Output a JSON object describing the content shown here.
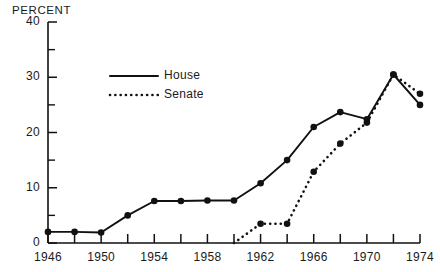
{
  "chart_data": {
    "type": "line",
    "title": "",
    "ylabel": "PERCENT",
    "xlabel": "",
    "ylim": [
      0,
      40
    ],
    "xlim": [
      1946,
      1974
    ],
    "grid": false,
    "legend_position": "upper-left-inside",
    "y_ticks_major": [
      0,
      10,
      20,
      30,
      40
    ],
    "y_ticks_minor": [
      5,
      15,
      25,
      35
    ],
    "y_tick_labels": [
      "0",
      "10",
      "20",
      "30",
      "40"
    ],
    "x_ticks": [
      1946,
      1948,
      1950,
      1952,
      1954,
      1956,
      1958,
      1960,
      1962,
      1964,
      1966,
      1968,
      1970,
      1972,
      1974
    ],
    "x_tick_labels_shown": [
      "1946",
      "1950",
      "1954",
      "1958",
      "1962",
      "1966",
      "1970",
      "1974"
    ],
    "x_tick_labels_values": [
      1946,
      1950,
      1954,
      1958,
      1962,
      1966,
      1970,
      1974
    ],
    "series": [
      {
        "name": "House",
        "style": "solid",
        "color": "#111111",
        "x": [
          1946,
          1948,
          1950,
          1952,
          1954,
          1956,
          1958,
          1960,
          1962,
          1964,
          1966,
          1968,
          1970,
          1972,
          1974
        ],
        "values": [
          2.0,
          2.0,
          1.9,
          5.0,
          7.6,
          7.6,
          7.7,
          7.7,
          10.8,
          15.0,
          21.0,
          23.7,
          22.4,
          30.5,
          25.0
        ]
      },
      {
        "name": "Senate",
        "style": "dotted",
        "color": "#111111",
        "x": [
          1960,
          1962,
          1964,
          1966,
          1968,
          1970,
          1972,
          1974
        ],
        "values": [
          0.0,
          3.5,
          3.5,
          12.9,
          18.0,
          21.8,
          30.5,
          27.0
        ]
      }
    ]
  },
  "legend": {
    "items": [
      {
        "label": "House",
        "style": "solid"
      },
      {
        "label": "Senate",
        "style": "dotted"
      }
    ]
  },
  "axis": {
    "y_title": "PERCENT"
  }
}
